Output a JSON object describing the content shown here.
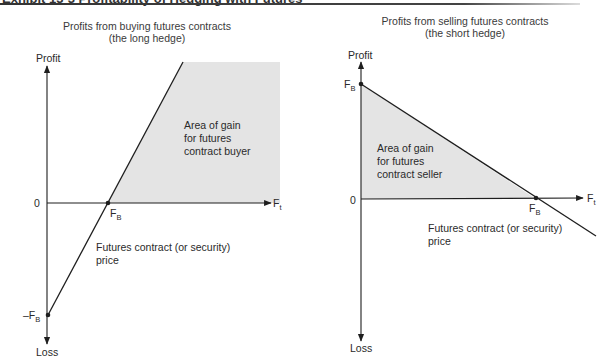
{
  "header": {
    "text": "Exhibit 13-3   Profitability of Hedging with Futures"
  },
  "left_panel": {
    "title_line1": "Profits from buying futures contracts",
    "title_line2": "(the long hedge)",
    "y_axis_top": "Profit",
    "y_axis_bottom": "Loss",
    "origin_label": "0",
    "x_axis_label_main": "F",
    "x_axis_label_sub": "t",
    "fb_label_main": "F",
    "fb_label_sub": "B",
    "neg_fb_label_main": "–F",
    "neg_fb_label_sub": "B",
    "area_line1": "Area of gain",
    "area_line2": "for futures",
    "area_line3": "contract buyer",
    "price_line1": "Futures contract (or security)",
    "price_line2": "price"
  },
  "right_panel": {
    "title_line1": "Profits from selling futures contracts",
    "title_line2": "(the short hedge)",
    "y_axis_top": "Profit",
    "y_axis_bottom": "Loss",
    "origin_label": "0",
    "x_axis_label_main": "F",
    "x_axis_label_sub": "t",
    "fb_y_label_main": "F",
    "fb_y_label_sub": "B",
    "fb_x_label_main": "F",
    "fb_x_label_sub": "B",
    "area_line1": "Area of gain",
    "area_line2": "for futures",
    "area_line3": "contract seller",
    "price_line1": "Futures contract (or security)",
    "price_line2": "price"
  },
  "colors": {
    "shade": "#e4e4e4",
    "line": "#1e1e1e",
    "text": "#2a2a2a"
  }
}
